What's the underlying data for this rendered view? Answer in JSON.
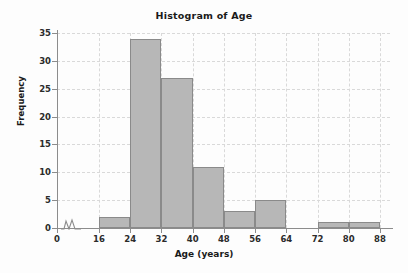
{
  "chart_data": {
    "type": "bar",
    "title": "Histogram of Age",
    "xlabel": "Age (years)",
    "ylabel": "Frequency",
    "bin_width": 8,
    "bin_edges": [
      16,
      24,
      32,
      40,
      48,
      56,
      64,
      72,
      80,
      88
    ],
    "categories": [
      "16-24",
      "24-32",
      "32-40",
      "40-48",
      "48-56",
      "56-64",
      "64-72",
      "72-80",
      "80-88"
    ],
    "values": [
      2,
      34,
      27,
      11,
      3,
      5,
      0,
      1,
      1
    ],
    "xlim": [
      16,
      88
    ],
    "ylim": [
      0,
      35
    ],
    "x_ticks": [
      "0",
      "16",
      "24",
      "32",
      "40",
      "48",
      "56",
      "64",
      "72",
      "80",
      "88"
    ],
    "y_ticks": [
      "0",
      "5",
      "10",
      "15",
      "20",
      "25",
      "30",
      "35"
    ],
    "y_tick_values": [
      0,
      5,
      10,
      15,
      20,
      25,
      30,
      35
    ],
    "grid": true,
    "legend": null,
    "axis_break": true,
    "bar_color": "#b7b7b7",
    "bar_border_color": "#8a8a8a",
    "grid_color": "#d9d9d9",
    "axis_color": "#8c8c8c",
    "text_color": "#1a1a1a"
  }
}
